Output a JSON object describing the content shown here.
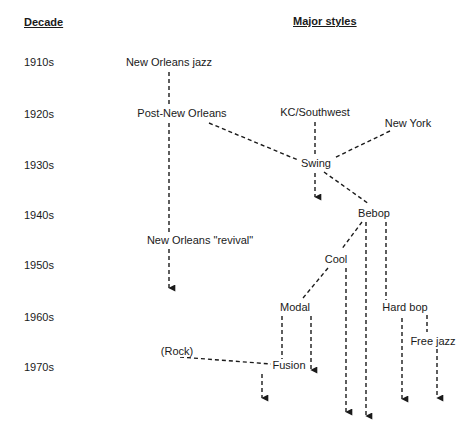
{
  "headers": {
    "decade": "Decade",
    "styles": "Major styles"
  },
  "decades": [
    {
      "label": "1910s",
      "y": 62
    },
    {
      "label": "1920s",
      "y": 114
    },
    {
      "label": "1930s",
      "y": 165
    },
    {
      "label": "1940s",
      "y": 215
    },
    {
      "label": "1950s",
      "y": 265
    },
    {
      "label": "1960s",
      "y": 317
    },
    {
      "label": "1970s",
      "y": 367
    }
  ],
  "nodes": {
    "new_orleans_jazz": {
      "label": "New Orleans jazz",
      "decade": "1910s"
    },
    "post_new_orleans": {
      "label": "Post-New Orleans",
      "decade": "1920s"
    },
    "kc_southwest": {
      "label": "KC/Southwest",
      "decade": "1920s"
    },
    "new_york": {
      "label": "New York",
      "decade": "1920s"
    },
    "swing": {
      "label": "Swing",
      "decade": "1930s"
    },
    "bebop": {
      "label": "Bebop",
      "decade": "1940s"
    },
    "new_orleans_revival": {
      "label": "New Orleans \"revival\"",
      "decade": "1940s-1950s"
    },
    "cool": {
      "label": "Cool",
      "decade": "1950s"
    },
    "modal": {
      "label": "Modal",
      "decade": "1960s"
    },
    "hard_bop": {
      "label": "Hard bop",
      "decade": "1960s"
    },
    "free_jazz": {
      "label": "Free jazz",
      "decade": "1960s"
    },
    "rock": {
      "label": "(Rock)",
      "decade": "1970s"
    },
    "fusion": {
      "label": "Fusion",
      "decade": "1970s"
    }
  },
  "edges": [
    {
      "from": "New Orleans jazz",
      "to": "Post-New Orleans"
    },
    {
      "from": "Post-New Orleans",
      "to": "New Orleans \"revival\"",
      "continues": true
    },
    {
      "from": "Post-New Orleans",
      "to": "Swing"
    },
    {
      "from": "KC/Southwest",
      "to": "Swing"
    },
    {
      "from": "New York",
      "to": "Swing"
    },
    {
      "from": "Swing",
      "to": null,
      "continues": true
    },
    {
      "from": "Swing",
      "to": "Bebop"
    },
    {
      "from": "Bebop",
      "to": "Cool"
    },
    {
      "from": "Bebop",
      "to": null,
      "continues": true
    },
    {
      "from": "Bebop",
      "to": "Hard bop"
    },
    {
      "from": "Cool",
      "to": "Modal"
    },
    {
      "from": "Cool",
      "to": null,
      "continues": true
    },
    {
      "from": "Modal",
      "to": "Fusion"
    },
    {
      "from": "Modal",
      "to": null,
      "continues": true
    },
    {
      "from": "(Rock)",
      "to": "Fusion"
    },
    {
      "from": "Fusion",
      "to": null,
      "continues": true
    },
    {
      "from": "Hard bop",
      "to": "Free jazz"
    },
    {
      "from": "Hard bop",
      "to": null,
      "continues": true
    },
    {
      "from": "Free jazz",
      "to": null,
      "continues": true
    }
  ],
  "colors": {
    "line": "#1a1a1a",
    "background": "#ffffff"
  }
}
